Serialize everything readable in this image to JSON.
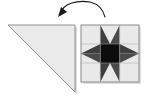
{
  "figure": {
    "background_color": "#ffffff"
  },
  "palette": {
    "background": "#ffffff",
    "light_fabric": "#e9e9e9",
    "light_fabric_alt": "#e2e2e2",
    "medium_dark_fabric": "#3f3f3f",
    "dark_fabric": "#4a4a4a",
    "center_fabric": "#0d0d0d",
    "outline": "#8a8a8a",
    "outline_dark": "#6f6f6f",
    "arrow": "#1a1a1a"
  },
  "triangle": {
    "name": "half-square-triangle-unit",
    "fabric": "light gray",
    "fill": "#eaeaea",
    "stroke": "#8f8f8f",
    "points": "8,25 75,25 75,92",
    "right_angle_corner": "top-right",
    "hypotenuse": "top-left to bottom-right"
  },
  "arrow": {
    "name": "rotation-arrow",
    "direction": "counterclockwise",
    "label": "",
    "path": "M 61,13 C 63,3 78,0 90,2 C 98,4 103,9 105,17",
    "head_points": "58,17 61,7 67,12",
    "color": "#1a1a1a",
    "stroke_width": 1.1
  },
  "block": {
    "name": "sawtooth-star-block",
    "pattern_name": "Sawtooth Star",
    "grid": "3x3",
    "x": 81,
    "y": 25,
    "width": 58,
    "height": 57,
    "cell_w": 19.333,
    "cell_h": 19.0,
    "border_color": "#8a8a8a",
    "cells": [
      {
        "row": 0,
        "col": 0,
        "type": "plain-square",
        "fill": "#e9e9e9"
      },
      {
        "row": 0,
        "col": 1,
        "type": "flying-geese-up",
        "fill": "#e9e9e9",
        "point_fill": "#3f3f3f"
      },
      {
        "row": 0,
        "col": 2,
        "type": "plain-square",
        "fill": "#e9e9e9"
      },
      {
        "row": 1,
        "col": 0,
        "type": "flying-geese-left",
        "fill": "#e9e9e9",
        "point_fill": "#3f3f3f"
      },
      {
        "row": 1,
        "col": 1,
        "type": "center-square",
        "fill": "#0d0d0d"
      },
      {
        "row": 1,
        "col": 2,
        "type": "flying-geese-right",
        "fill": "#e9e9e9",
        "point_fill": "#3f3f3f"
      },
      {
        "row": 2,
        "col": 0,
        "type": "plain-square",
        "fill": "#e9e9e9"
      },
      {
        "row": 2,
        "col": 1,
        "type": "flying-geese-down",
        "fill": "#e9e9e9",
        "point_fill": "#3f3f3f"
      },
      {
        "row": 2,
        "col": 2,
        "type": "plain-square",
        "fill": "#e9e9e9"
      }
    ]
  }
}
